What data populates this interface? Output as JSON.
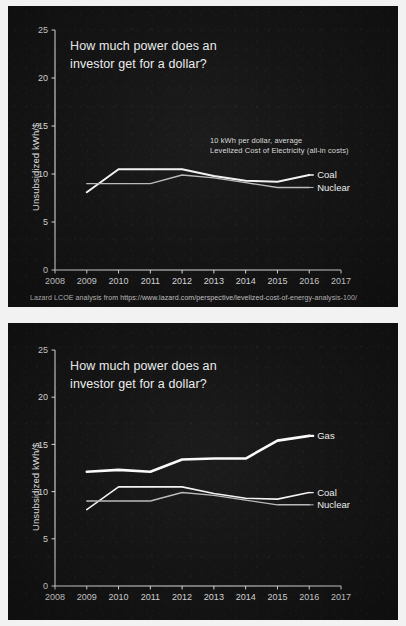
{
  "slide": {
    "headline_line1": "How much power does an",
    "headline_line2": "investor get for a dollar?",
    "background_color": "#141414",
    "ink_color": "#ededed"
  },
  "top_panel": {
    "annotation_line1": "10 kWh per dollar, average",
    "annotation_line2": "Levelized Cost of Electricity (all-in costs)",
    "source_note": "Lazard LCOE analysis from https://www.lazard.com/perspective/levelized-cost-of-energy-analysis-100/"
  },
  "chart_data": [
    {
      "id": "chart-top",
      "type": "line",
      "title": "How much power does an investor get for a dollar?",
      "xlabel": "",
      "ylabel": "Unsubsidized kWh/$",
      "x": [
        2009,
        2010,
        2011,
        2012,
        2013,
        2014,
        2015,
        2016
      ],
      "xlim": [
        2008,
        2017
      ],
      "ylim": [
        0,
        25
      ],
      "xticks": [
        "2008",
        "2009",
        "2010",
        "2011",
        "2012",
        "2013",
        "2014",
        "2015",
        "2016",
        "2017"
      ],
      "yticks": [
        "0",
        "5",
        "10",
        "15",
        "20",
        "25"
      ],
      "grid": false,
      "legend_position": "right-inline",
      "annotations": [
        "10 kWh per dollar, average",
        "Levelized Cost of Electricity (all-in costs)"
      ],
      "series": [
        {
          "name": "Coal",
          "color": "#f2f2f2",
          "width": 2.0,
          "values": [
            8.1,
            10.5,
            10.5,
            10.5,
            9.8,
            9.3,
            9.2,
            9.9
          ]
        },
        {
          "name": "Nuclear",
          "color": "#b9b9b9",
          "width": 1.4,
          "values": [
            9.0,
            9.0,
            9.0,
            9.9,
            9.6,
            9.1,
            8.6,
            8.6
          ]
        }
      ]
    },
    {
      "id": "chart-bottom",
      "type": "line",
      "title": "How much power does an investor get for a dollar?",
      "xlabel": "",
      "ylabel": "Unsubsidized kWh/$",
      "x": [
        2009,
        2010,
        2011,
        2012,
        2013,
        2014,
        2015,
        2016
      ],
      "xlim": [
        2008,
        2017
      ],
      "ylim": [
        0,
        25
      ],
      "xticks": [
        "2008",
        "2009",
        "2010",
        "2011",
        "2012",
        "2013",
        "2014",
        "2015",
        "2016",
        "2017"
      ],
      "yticks": [
        "0",
        "5",
        "10",
        "15",
        "20",
        "25"
      ],
      "grid": false,
      "legend_position": "right-inline",
      "annotations": [],
      "series": [
        {
          "name": "Gas",
          "color": "#fafafa",
          "width": 2.6,
          "values": [
            12.1,
            12.3,
            12.1,
            13.4,
            13.5,
            13.5,
            15.4,
            15.9
          ]
        },
        {
          "name": "Coal",
          "color": "#f2f2f2",
          "width": 1.6,
          "values": [
            8.1,
            10.5,
            10.5,
            10.5,
            9.8,
            9.3,
            9.2,
            9.9
          ]
        },
        {
          "name": "Nuclear",
          "color": "#b9b9b9",
          "width": 1.4,
          "values": [
            9.0,
            9.0,
            9.0,
            9.9,
            9.6,
            9.1,
            8.6,
            8.6
          ]
        }
      ]
    }
  ]
}
